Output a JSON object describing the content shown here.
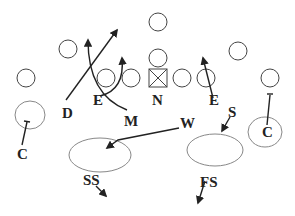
{
  "diagram": {
    "type": "football-play-diagram",
    "offense_markers": "circles",
    "center_marker": "box-with-x",
    "defense_labels": [
      {
        "id": "D",
        "text": "D"
      },
      {
        "id": "E_left",
        "text": "E"
      },
      {
        "id": "M",
        "text": "M"
      },
      {
        "id": "N",
        "text": "N"
      },
      {
        "id": "E_right",
        "text": "E"
      },
      {
        "id": "W",
        "text": "W"
      },
      {
        "id": "S",
        "text": "S"
      },
      {
        "id": "C_left",
        "text": "C"
      },
      {
        "id": "C_right",
        "text": "C"
      },
      {
        "id": "SS",
        "text": "SS"
      },
      {
        "id": "FS",
        "text": "FS"
      }
    ],
    "zones": [
      {
        "name": "left-flat-zone",
        "owner": "C"
      },
      {
        "name": "strong-hook-zone",
        "owner": "W"
      },
      {
        "name": "weak-hook-zone",
        "owner": "S"
      },
      {
        "name": "right-flat-zone",
        "owner": "C"
      }
    ],
    "colors": {
      "line": "#222222",
      "player_outline": "#444444",
      "zone_outline": "#888888",
      "background": "#ffffff"
    }
  }
}
